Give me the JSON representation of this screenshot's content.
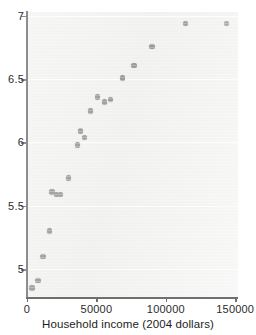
{
  "figure": {
    "background_color": "#ffffff",
    "plot_background_color": "#f0f0ef",
    "marker_color": "#8f8f8f",
    "axis_color": "#8d8d8d"
  },
  "chart_data": {
    "type": "scatter",
    "title": "",
    "xlabel": "Household income (2004 dollars)",
    "ylabel": "",
    "xlim": [
      0,
      152000
    ],
    "ylim": [
      4.78,
      7.03
    ],
    "xticks": [
      0,
      50000,
      100000,
      150000
    ],
    "xticklabels": [
      "0",
      "50000",
      "100000",
      "150000"
    ],
    "yticks": [
      5,
      5.5,
      6,
      6.5,
      7
    ],
    "yticklabels": [
      "5",
      "5.5",
      "6",
      "6.5",
      "7"
    ],
    "grid": true,
    "grid_axis": "y",
    "legend": null,
    "series": [
      {
        "name": "households",
        "marker": "circle",
        "color": "#8f8f8f",
        "points": [
          {
            "x": 3600,
            "y": 4.85
          },
          {
            "x": 7900,
            "y": 4.91
          },
          {
            "x": 11400,
            "y": 5.1
          },
          {
            "x": 16400,
            "y": 5.3
          },
          {
            "x": 17900,
            "y": 5.61
          },
          {
            "x": 21400,
            "y": 5.59
          },
          {
            "x": 24300,
            "y": 5.59
          },
          {
            "x": 30000,
            "y": 5.72
          },
          {
            "x": 36400,
            "y": 5.98
          },
          {
            "x": 38600,
            "y": 6.09
          },
          {
            "x": 41400,
            "y": 6.04
          },
          {
            "x": 45700,
            "y": 6.25
          },
          {
            "x": 50700,
            "y": 6.36
          },
          {
            "x": 55700,
            "y": 6.32
          },
          {
            "x": 60000,
            "y": 6.34
          },
          {
            "x": 68600,
            "y": 6.51
          },
          {
            "x": 77100,
            "y": 6.61
          },
          {
            "x": 90000,
            "y": 6.76
          },
          {
            "x": 114300,
            "y": 6.94
          },
          {
            "x": 143600,
            "y": 6.94
          }
        ]
      }
    ]
  }
}
